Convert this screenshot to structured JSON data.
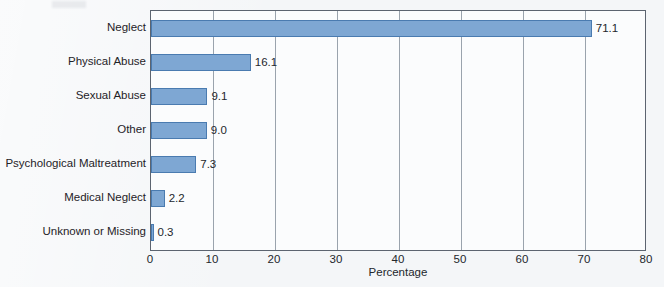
{
  "chart_data": {
    "type": "bar",
    "orientation": "horizontal",
    "title": "",
    "xlabel": "Percentage",
    "ylabel": "",
    "xlim": [
      0,
      80
    ],
    "xticks": [
      0,
      10,
      20,
      30,
      40,
      50,
      60,
      70,
      80
    ],
    "grid": true,
    "legend": null,
    "categories": [
      "Neglect",
      "Physical Abuse",
      "Sexual Abuse",
      "Other",
      "Psychological Maltreatment",
      "Medical Neglect",
      "Unknown or Missing"
    ],
    "values": [
      71.1,
      16.1,
      9.1,
      9.0,
      7.3,
      2.2,
      0.3
    ],
    "value_labels": [
      "71.1",
      "16.1",
      "9.1",
      "9.0",
      "7.3",
      "2.2",
      "0.3"
    ],
    "bar_color": "#7ea7d3",
    "bar_border_color": "#4a7bb0",
    "axis_color": "#5c6470",
    "grid_color": "#9aa3ad",
    "background_color": "#f4f6f8"
  }
}
